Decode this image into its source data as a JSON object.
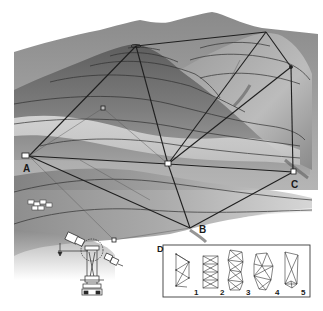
{
  "figure": {
    "stations": [
      {
        "id": "A",
        "label": "A",
        "x": 29,
        "y": 156
      },
      {
        "id": "B",
        "label": "B",
        "x": 190,
        "y": 228
      },
      {
        "id": "C",
        "label": "C",
        "x": 293,
        "y": 172
      }
    ],
    "inset": {
      "label": "D",
      "patterns": [
        {
          "label": "1"
        },
        {
          "label": "2"
        },
        {
          "label": "3"
        },
        {
          "label": "4"
        },
        {
          "label": "5"
        }
      ]
    },
    "instrument": "theodolite-icon",
    "colors": {
      "terrain_dark": "#6e6e6e",
      "terrain_mid": "#9a9a9a",
      "terrain_light": "#d8d8d8",
      "lines": "#222222",
      "background": "#ffffff"
    }
  }
}
